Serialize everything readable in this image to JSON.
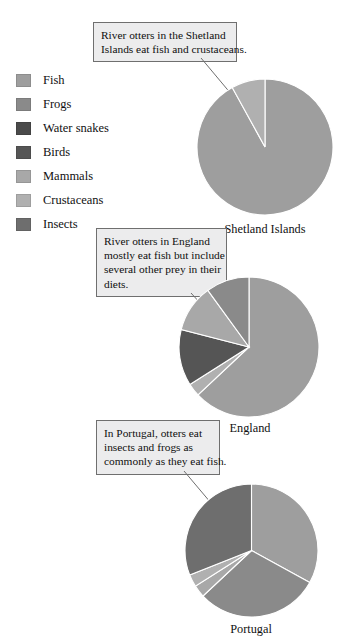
{
  "figure": {
    "background": "#ffffff",
    "pie_border": "#ffffff"
  },
  "legend": {
    "items": [
      {
        "label": "Fish",
        "color": "#9e9e9e"
      },
      {
        "label": "Frogs",
        "color": "#8a8a8a"
      },
      {
        "label": "Water snakes",
        "color": "#4a4a4a"
      },
      {
        "label": "Birds",
        "color": "#555555"
      },
      {
        "label": "Mammals",
        "color": "#a8a8a8"
      },
      {
        "label": "Crustaceans",
        "color": "#b0b0b0"
      },
      {
        "label": "Insects",
        "color": "#6e6e6e"
      }
    ]
  },
  "callouts": [
    {
      "id": "callout-shetland",
      "lines": [
        "River otters in the Shetland",
        "Islands eat fish and crustaceans."
      ]
    },
    {
      "id": "callout-england",
      "lines": [
        "River otters in England",
        "mostly eat fish but include",
        "several other prey in their",
        "diets."
      ]
    },
    {
      "id": "callout-portugal",
      "lines": [
        "In Portugal, otters eat",
        "insects and frogs as",
        "commonly as they eat fish."
      ]
    }
  ],
  "chart_data": [
    {
      "type": "pie",
      "title": "Shetland Islands",
      "categories": [
        "Fish",
        "Crustaceans"
      ],
      "values": [
        92,
        8
      ],
      "colors": [
        "#9e9e9e",
        "#b0b0b0"
      ],
      "start_angle": 90,
      "direction": "clockwise",
      "xlabel": "",
      "ylabel": "",
      "legend_position": "left"
    },
    {
      "type": "pie",
      "title": "England",
      "categories": [
        "Fish",
        "Crustaceans",
        "Birds",
        "Mammals",
        "Frogs"
      ],
      "values": [
        63,
        3,
        13,
        11,
        10
      ],
      "colors": [
        "#9e9e9e",
        "#b0b0b0",
        "#555555",
        "#a8a8a8",
        "#8a8a8a"
      ],
      "start_angle": 90,
      "direction": "clockwise",
      "xlabel": "",
      "ylabel": "",
      "legend_position": "left"
    },
    {
      "type": "pie",
      "title": "Portugal",
      "categories": [
        "Fish",
        "Frogs",
        "Mammals",
        "Crustaceans",
        "Insects"
      ],
      "values": [
        33,
        30,
        3,
        3,
        31
      ],
      "colors": [
        "#9e9e9e",
        "#8a8a8a",
        "#a8a8a8",
        "#b0b0b0",
        "#6e6e6e"
      ],
      "start_angle": 90,
      "direction": "clockwise",
      "xlabel": "",
      "ylabel": "",
      "legend_position": "left"
    }
  ]
}
